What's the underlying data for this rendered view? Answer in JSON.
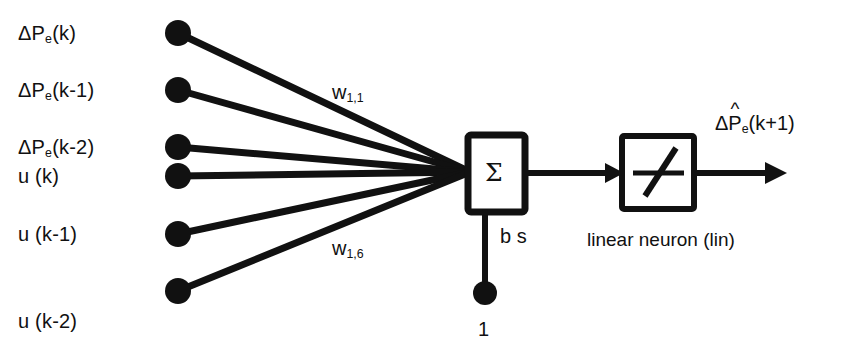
{
  "figure": {
    "background_color": "#ffffff",
    "ink_color": "#111111"
  },
  "inputs": {
    "labels": [
      {
        "id": "dpe-k",
        "text_pre": "ΔP",
        "sub": "e",
        "text_post": "(k)"
      },
      {
        "id": "dpe-k1",
        "text_pre": "ΔP",
        "sub": "e",
        "text_post": "(k-1)"
      },
      {
        "id": "dpe-k2",
        "text_pre": "ΔP",
        "sub": "e",
        "text_post": "(k-2)"
      },
      {
        "id": "u-k",
        "text_pre": "u (k)",
        "sub": "",
        "text_post": ""
      },
      {
        "id": "u-k1",
        "text_pre": "u (k-1)",
        "sub": "",
        "text_post": ""
      },
      {
        "id": "u-k2",
        "text_pre": "u (k-2)",
        "sub": "",
        "text_post": ""
      }
    ],
    "plain": [
      "ΔPe(k)",
      "ΔPe(k-1)",
      "ΔPe(k-2)",
      "u (k)",
      "u (k-1)",
      "u (k-2)"
    ],
    "node_count": 6
  },
  "weights": {
    "first_label": {
      "symbol": "w",
      "sub": "1,1",
      "plain": "w1,1"
    },
    "last_label": {
      "symbol": "w",
      "sub": "1,6",
      "plain": "w1,6"
    }
  },
  "summation": {
    "symbol": "Σ",
    "name": "summation-block"
  },
  "bias": {
    "label": "b s",
    "source_value": "1"
  },
  "activation": {
    "caption": "linear neuron (lin)",
    "symbol_name": "linear-transfer-function"
  },
  "output": {
    "text_pre": "ΔP",
    "hat": "^",
    "sub": "e",
    "text_post": "(k+1)",
    "plain": "ΔP̂e(k+1)"
  }
}
